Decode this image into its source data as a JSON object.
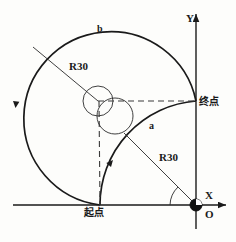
{
  "figure": {
    "title": "",
    "width": 236,
    "height": 242,
    "background_color": "#fdfdfb",
    "line_color": "#1a1a1a"
  },
  "axes": {
    "x_label": "X",
    "y_label": "Y",
    "origin_label": "O",
    "origin_px": {
      "x": 196,
      "y": 205
    },
    "x_axis": {
      "from_x": 13,
      "to_x": 229,
      "y": 205
    },
    "y_axis": {
      "x": 196,
      "from_y": 228,
      "to_y": 12
    }
  },
  "labels": {
    "arc_outer": "b",
    "arc_inner": "a",
    "radius_outer": "R30",
    "radius_inner": "R30",
    "start_point": "起点",
    "end_point": "终点"
  },
  "geometry": {
    "outer_arc": {
      "name": "b",
      "center": {
        "x": 98,
        "y": 101
      },
      "radius": 87,
      "radius_value": "R30",
      "start_point": {
        "x": 100,
        "y": 205
      },
      "end_point": {
        "x": 196,
        "y": 101
      },
      "direction": "counter-clockwise",
      "sweep_flag": 1,
      "large_arc": 1
    },
    "inner_arc": {
      "name": "a",
      "center": {
        "x": 196,
        "y": 205
      },
      "radius": 104,
      "radius_value": "R30",
      "start_point": {
        "x": 100,
        "y": 205
      },
      "end_point": {
        "x": 196,
        "y": 101
      },
      "direction": "clockwise",
      "sweep_flag": 1,
      "large_arc": 0
    },
    "center_circles": [
      {
        "name": "outer-arc-center-circle",
        "cx": 98,
        "cy": 101,
        "r": 15
      },
      {
        "name": "inner-arc-center-circle",
        "cx": 115,
        "cy": 116,
        "r": 18
      }
    ],
    "origin_marker": {
      "cx": 196,
      "cy": 205,
      "r": 6
    },
    "dashed_lines": [
      {
        "name": "horizontal-center-line",
        "x1": 98,
        "y1": 101,
        "x2": 196,
        "y2": 101
      },
      {
        "name": "vertical-center-line",
        "x1": 99,
        "y1": 101,
        "x2": 100,
        "y2": 205
      }
    ],
    "leader_lines": [
      {
        "name": "outer-radius-leader",
        "x1": 98,
        "y1": 101,
        "x2": 33,
        "y2": 47
      },
      {
        "name": "inner-radius-leader",
        "x1": 196,
        "y1": 205,
        "x2": 124,
        "y2": 133
      }
    ],
    "angle_arc": {
      "center": {
        "x": 196,
        "y": 205
      },
      "radius": 26,
      "from_deg": 180,
      "to_deg": 225
    },
    "direction_arrows": [
      {
        "name": "outer-arc-direction-arrow",
        "x": 16,
        "y": 106,
        "angle_deg": 94
      },
      {
        "name": "inner-arc-direction-arrow",
        "x": 112,
        "y": 161,
        "angle_deg": 41
      }
    ]
  }
}
